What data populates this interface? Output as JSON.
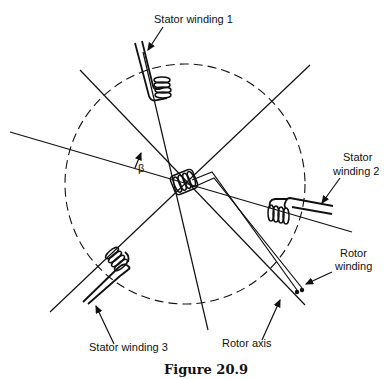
{
  "figure": {
    "caption": "Figure 20.9",
    "labels": {
      "stator1": "Stator winding 1",
      "stator2_line1": "Stator",
      "stator2_line2": "winding 2",
      "stator3": "Stator winding 3",
      "rotor_winding_line1": "Rotor",
      "rotor_winding_line2": "winding",
      "rotor_axis": "Rotor axis",
      "angle": "β"
    },
    "geometry": {
      "center": [
        185,
        185
      ],
      "air_gap_circle_radius": 120
    }
  }
}
